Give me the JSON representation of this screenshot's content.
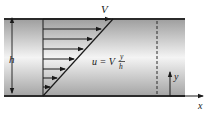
{
  "diagram": {
    "type": "couette-flow-velocity-profile",
    "labels": {
      "top_plate_velocity": "V",
      "gap_height": "h",
      "formula_lhs": "u = V",
      "formula_num": "y",
      "formula_den": "h",
      "y_axis": "y",
      "x_axis": "x"
    },
    "colors": {
      "plate": "#2b2b2b",
      "fluid_edge": "#a8a8a8",
      "fluid_center": "#f2f2f2",
      "arrows": "#1a1a1a"
    },
    "profile": {
      "arrow_count": 7,
      "shape": "linear"
    }
  }
}
